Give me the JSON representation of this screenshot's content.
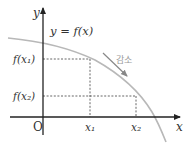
{
  "diagram": {
    "colors": {
      "axis": "#222222",
      "curve": "#b8b8b8",
      "guide": "#555555",
      "annotation": "#9a9a9a"
    },
    "axes": {
      "y_label": "y",
      "x_label": "x",
      "origin_label": "O"
    },
    "curve_label": "y = f(x)",
    "points": [
      {
        "x_label": "x₁",
        "y_label": "f(x₁)"
      },
      {
        "x_label": "x₂",
        "y_label": "f(x₂)"
      }
    ],
    "annotation": {
      "text": "감소",
      "meaning": "decreasing"
    }
  }
}
